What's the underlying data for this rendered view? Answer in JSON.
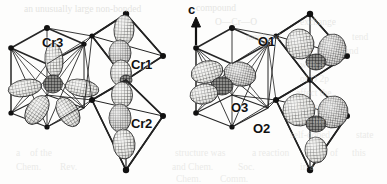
{
  "figure": {
    "kind": "crystal-structure-orbital-diagram",
    "width": 387,
    "height": 184,
    "background_color": "#fdfdfc",
    "ink_color": "#2b2b2b",
    "mesh_color": "#5a5a5a"
  },
  "axis": {
    "label": "c",
    "direction": "up",
    "x": 188,
    "y": 4
  },
  "site_labels": [
    {
      "text": "Cr3",
      "x": 42,
      "y": 35,
      "size": "sz13"
    },
    {
      "text": "Cr1",
      "x": 131,
      "y": 57,
      "size": "sz13"
    },
    {
      "text": "Cr2",
      "x": 131,
      "y": 116,
      "size": "sz13"
    },
    {
      "text": "O1",
      "x": 258,
      "y": 34,
      "size": "sz13"
    },
    {
      "text": "O3",
      "x": 231,
      "y": 100,
      "size": "sz13"
    },
    {
      "text": "O2",
      "x": 253,
      "y": 121,
      "size": "sz13"
    }
  ],
  "clusters": [
    {
      "name": "left-cluster",
      "caption": "Chromium sites Cr1, Cr2, Cr3 with d-orbital lobes"
    },
    {
      "name": "right-cluster",
      "caption": "Oxygen sites O1, O2, O3 with p-orbital lobes"
    }
  ],
  "background_text": [
    {
      "text": "an unusually large non-bonded",
      "x": 24,
      "y": 4,
      "op": 0.55
    },
    {
      "text": "compound",
      "x": 196,
      "y": 3,
      "op": 0.5
    },
    {
      "text": "O—Cr—O",
      "x": 215,
      "y": 17,
      "op": 0.5
    },
    {
      "text": "exchange",
      "x": 300,
      "y": 17,
      "op": 0.45
    },
    {
      "text": "mediated",
      "x": 246,
      "y": 32,
      "op": 0.4
    },
    {
      "text": "tend",
      "x": 352,
      "y": 32,
      "op": 0.4
    },
    {
      "text": "the",
      "x": 300,
      "y": 46,
      "op": 0.4
    },
    {
      "text": "band",
      "x": 340,
      "y": 46,
      "op": 0.4
    },
    {
      "text": "with a",
      "x": 300,
      "y": 60,
      "op": 0.4
    },
    {
      "text": "of O 2p",
      "x": 300,
      "y": 74,
      "op": 0.4
    },
    {
      "text": "affect the",
      "x": 296,
      "y": 88,
      "op": 0.4
    },
    {
      "text": "the order",
      "x": 296,
      "y": 102,
      "op": 0.4
    },
    {
      "text": "As the",
      "x": 300,
      "y": 116,
      "op": 0.4
    },
    {
      "text": "self-doped",
      "x": 290,
      "y": 130,
      "op": 0.4
    },
    {
      "text": "state",
      "x": 356,
      "y": 130,
      "op": 0.4
    },
    {
      "text": "a",
      "x": 16,
      "y": 148,
      "op": 0.4
    },
    {
      "text": "of the",
      "x": 30,
      "y": 148,
      "op": 0.4
    },
    {
      "text": "structure was",
      "x": 175,
      "y": 148,
      "op": 0.4
    },
    {
      "text": "a reaction",
      "x": 252,
      "y": 148,
      "op": 0.4
    },
    {
      "text": "of",
      "x": 330,
      "y": 148,
      "op": 0.4
    },
    {
      "text": "this",
      "x": 352,
      "y": 148,
      "op": 0.4
    },
    {
      "text": "Chem.",
      "x": 16,
      "y": 162,
      "op": 0.4
    },
    {
      "text": "Rev.",
      "x": 60,
      "y": 162,
      "op": 0.4
    },
    {
      "text": "and Chem.",
      "x": 172,
      "y": 162,
      "op": 0.4
    },
    {
      "text": "Soc.",
      "x": 238,
      "y": 162,
      "op": 0.4
    },
    {
      "text": "in a",
      "x": 300,
      "y": 162,
      "op": 0.4
    },
    {
      "text": "Chem.",
      "x": 176,
      "y": 174,
      "op": 0.4
    },
    {
      "text": "Comm.",
      "x": 220,
      "y": 174,
      "op": 0.4
    }
  ]
}
